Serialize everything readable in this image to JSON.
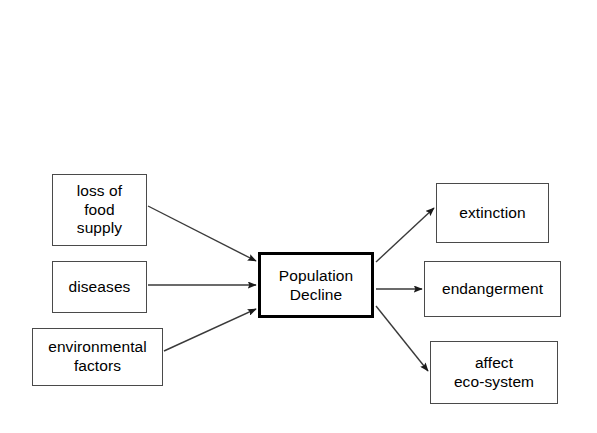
{
  "diagram": {
    "background_color": "#ffffff",
    "stroke_color": "#4a4a4a",
    "center_stroke_color": "#000000",
    "text_color": "#000000",
    "center": {
      "label": "Population\nDecline",
      "line1": "Population",
      "line2": "Decline"
    },
    "causes": [
      {
        "id": "loss-of-food-supply",
        "label": "loss of\nfood\nsupply"
      },
      {
        "id": "diseases",
        "label": "diseases"
      },
      {
        "id": "environmental-factors",
        "label": "environmental\nfactors"
      }
    ],
    "effects": [
      {
        "id": "extinction",
        "label": "extinction"
      },
      {
        "id": "endangerment",
        "label": "endangerment"
      },
      {
        "id": "affect-eco-system",
        "label": "affect\neco-system"
      }
    ],
    "connectors": [
      {
        "id": "loss-of-food-supply-to-population-decline",
        "from": "loss of food supply",
        "to": "Population Decline"
      },
      {
        "id": "diseases-to-population-decline",
        "from": "diseases",
        "to": "Population Decline"
      },
      {
        "id": "environmental-factors-to-population-decline",
        "from": "environmental factors",
        "to": "Population Decline"
      },
      {
        "id": "population-decline-to-extinction",
        "from": "Population Decline",
        "to": "extinction"
      },
      {
        "id": "population-decline-to-endangerment",
        "from": "Population Decline",
        "to": "endangerment"
      },
      {
        "id": "population-decline-to-affect-eco-system",
        "from": "Population Decline",
        "to": "affect eco-system"
      }
    ]
  }
}
